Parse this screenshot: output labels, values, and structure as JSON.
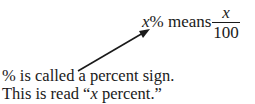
{
  "definition": {
    "variable": "x",
    "symbol": "%",
    "word": "means",
    "fraction": {
      "numerator": "x",
      "denominator": "100"
    }
  },
  "annotation": {
    "line1": "% is called a percent sign.",
    "line2_prefix": "This is read “",
    "line2_var": "x",
    "line2_suffix": " percent.”"
  },
  "arrow": {
    "from": [
      78,
      71
    ],
    "to": [
      149,
      30
    ],
    "color": "#1a1a1a"
  }
}
